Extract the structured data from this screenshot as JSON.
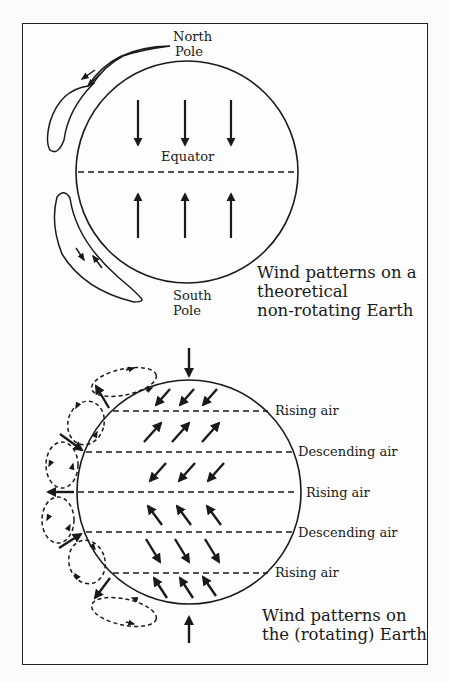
{
  "page": {
    "header_left": "",
    "header_right": ""
  },
  "top_diagram": {
    "north_pole_line1": "North",
    "north_pole_line2": "Pole",
    "equator_label": "Equator",
    "south_pole_line1": "South",
    "south_pole_line2": "Pole",
    "caption_line1": "Wind patterns on a",
    "caption_line2": "theoretical",
    "caption_line3": "non-rotating Earth",
    "north_arrows": [
      "down",
      "down",
      "down"
    ],
    "south_arrows": [
      "up",
      "up",
      "up"
    ]
  },
  "bottom_diagram": {
    "latitude_lines": [
      {
        "label": "Rising air"
      },
      {
        "label": "Descending air"
      },
      {
        "label": "Rising air"
      },
      {
        "label": "Descending air"
      },
      {
        "label": "Rising air"
      }
    ],
    "caption_line1": "Wind patterns on",
    "caption_line2": "the (rotating) Earth",
    "wind_bands": [
      "SW",
      "NE",
      "SW",
      "NW",
      "SE",
      "NW"
    ]
  },
  "colors": {
    "ink": "#1a1a1a",
    "paper": "#fdfdfd"
  }
}
